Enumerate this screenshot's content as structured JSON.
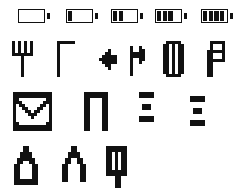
{
  "sheet": {
    "title": "pixel-icon-sheet",
    "background": "#ffffff",
    "ink": "#111111",
    "pixel_size": 3,
    "rows": [
      {
        "name": "battery-indicator-row",
        "kind": "battery",
        "y": 0,
        "items": [
          {
            "name": "battery-empty",
            "label": "Battery 0 of 4",
            "bars": 0,
            "x": 18
          },
          {
            "name": "battery-one-quarter",
            "label": "Battery 1 of 4",
            "bars": 1,
            "x": 66
          },
          {
            "name": "battery-half",
            "label": "Battery 2 of 4",
            "bars": 2,
            "x": 111
          },
          {
            "name": "battery-three-quarter",
            "label": "Battery 3 of 4",
            "bars": 3,
            "x": 155
          },
          {
            "name": "battery-full",
            "label": "Battery 4 of 4",
            "bars": 4,
            "x": 201
          }
        ]
      },
      {
        "name": "glyph-row-2",
        "kind": "glyph",
        "y": 41,
        "items": [
          {
            "name": "trident-psi-glyph",
            "label": "Psi / trident",
            "x": 12,
            "y": 0,
            "cols": 7,
            "rows": 13,
            "px": 3,
            "bitmap": [
              "1010101",
              "1010101",
              "1010101",
              "1010101",
              "1111111",
              "0001000",
              "0001000",
              "0001000",
              "0001000",
              "0001000",
              "0001000",
              "0001000",
              "0000000"
            ]
          },
          {
            "name": "corner-gamma-glyph",
            "label": "Gamma / corner",
            "x": 57,
            "y": 0,
            "cols": 6,
            "rows": 12,
            "px": 3,
            "bitmap": [
              "111111",
              "100000",
              "100000",
              "100000",
              "100000",
              "100000",
              "100000",
              "100000",
              "100000",
              "100000",
              "100000",
              "100000"
            ]
          },
          {
            "name": "left-arrow-marker-glyph",
            "label": "Left arrow marker",
            "x": 99,
            "y": 8,
            "cols": 6,
            "rows": 8,
            "px": 3,
            "bitmap": [
              "000100",
              "001100",
              "011111",
              "111111",
              "011111",
              "001100",
              "000100",
              "000000"
            ]
          },
          {
            "name": "right-arrow-marker-glyph",
            "label": "Right arrow marker",
            "x": 130,
            "y": 5,
            "cols": 5,
            "rows": 12,
            "px": 3,
            "bitmap": [
              "10010",
              "10011",
              "11111",
              "11111",
              "10011",
              "10010",
              "10000",
              "10000",
              "10000",
              "10000",
              "00000",
              "00000"
            ]
          },
          {
            "name": "hollow-capsule-glyph",
            "label": "Hollow capsule / zero",
            "x": 163,
            "y": 0,
            "cols": 7,
            "rows": 13,
            "px": 3,
            "bitmap": [
              "0111110",
              "1101011",
              "1101011",
              "1101011",
              "1101011",
              "1101011",
              "1101011",
              "1101011",
              "1101011",
              "1101011",
              "1101011",
              "0111110",
              "0000000"
            ]
          },
          {
            "name": "beta-letter-glyph",
            "label": "Beta / P letter",
            "x": 207,
            "y": 0,
            "cols": 6,
            "rows": 13,
            "px": 3,
            "bitmap": [
              "011111",
              "010001",
              "010001",
              "111111",
              "110001",
              "110001",
              "111111",
              "110000",
              "110000",
              "110000",
              "110000",
              "110000",
              "000000"
            ]
          }
        ]
      },
      {
        "name": "glyph-row-3",
        "kind": "glyph",
        "y": 92,
        "items": [
          {
            "name": "envelope-mail-icon",
            "label": "Envelope / new message",
            "x": 13,
            "y": 0,
            "cols": 13,
            "rows": 13,
            "px": 3,
            "bitmap": [
              "1111111111111",
              "1111111111111",
              "1100000000011",
              "1110000000111",
              "1011000001101",
              "1001100011001",
              "1000110110001",
              "1000011100001",
              "1000001000001",
              "1000000000001",
              "1100000000011",
              "1111111111111",
              "1111111111111"
            ]
          },
          {
            "name": "arch-gate-glyph",
            "label": "Arch / gate",
            "x": 84,
            "y": 0,
            "cols": 8,
            "rows": 13,
            "px": 3,
            "bitmap": [
              "11111111",
              "11111111",
              "11000011",
              "11000011",
              "11000011",
              "11000011",
              "11000011",
              "11000011",
              "11000011",
              "11000011",
              "11000011",
              "11000011",
              "11000011"
            ]
          },
          {
            "name": "menu-lines-glyph-narrow",
            "label": "Menu lines (narrow)",
            "x": 139,
            "y": 0,
            "cols": 5,
            "rows": 11,
            "px": 3,
            "bitmap": [
              "11111",
              "11111",
              "00000",
              "00000",
              "01110",
              "01110",
              "00000",
              "00000",
              "11111",
              "11111",
              "00000"
            ]
          },
          {
            "name": "menu-lines-glyph-wide",
            "label": "Menu lines (wide)",
            "x": 190,
            "y": 4,
            "cols": 5,
            "rows": 11,
            "px": 3,
            "bitmap": [
              "11111",
              "11111",
              "00000",
              "00000",
              "01110",
              "01110",
              "00000",
              "00000",
              "11111",
              "11111",
              "00000"
            ]
          }
        ]
      },
      {
        "name": "glyph-row-4",
        "kind": "glyph",
        "y": 146,
        "items": [
          {
            "name": "padlock-closed-icon",
            "label": "Padlock closed",
            "x": 14,
            "y": 0,
            "cols": 8,
            "rows": 13,
            "px": 3,
            "bitmap": [
              "00011000",
              "00011000",
              "00111100",
              "00111100",
              "01111110",
              "01100110",
              "11000011",
              "11000011",
              "11000011",
              "11000011",
              "11000011",
              "11111111",
              "11111111"
            ]
          },
          {
            "name": "padlock-open-icon",
            "label": "Padlock open / arch",
            "x": 62,
            "y": 0,
            "cols": 8,
            "rows": 13,
            "px": 3,
            "bitmap": [
              "00011000",
              "00011000",
              "00111100",
              "00111100",
              "01100110",
              "01100110",
              "11000011",
              "11000011",
              "11000011",
              "11000011",
              "11000011",
              "11000011",
              "00000000"
            ]
          },
          {
            "name": "antenna-signal-glyph",
            "label": "Antenna / signal post",
            "x": 106,
            "y": 0,
            "cols": 7,
            "rows": 15,
            "px": 3,
            "bitmap": [
              "1111111",
              "1111111",
              "1101011",
              "1101011",
              "1101011",
              "1101011",
              "1101011",
              "1101011",
              "1111111",
              "1111111",
              "0001100",
              "0001100",
              "0001100",
              "0001100",
              "0000000"
            ]
          }
        ]
      }
    ]
  }
}
